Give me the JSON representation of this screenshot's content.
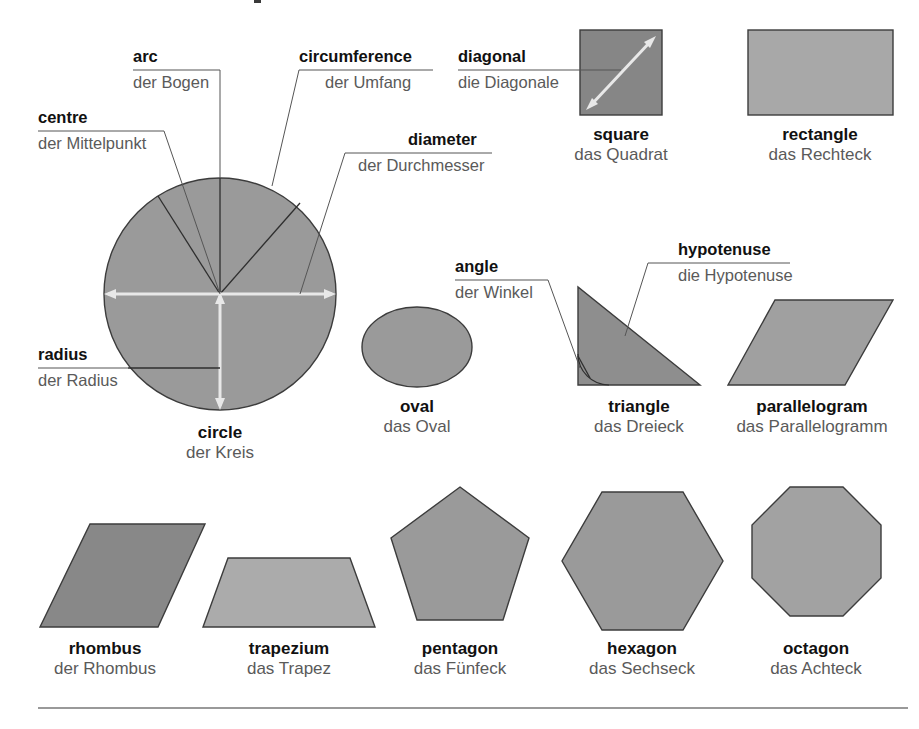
{
  "page": {
    "background_color": "#ffffff",
    "divider_color": "#777777"
  },
  "palette": {
    "shape_medium": "#9a9a9a",
    "shape_dark": "#868686",
    "shape_light": "#ababab",
    "outline": "#3c3c3c",
    "arrow_white": "#e8e8e8",
    "leader_line": "#555555",
    "text_english": "#111111",
    "text_german": "#5a5a5a"
  },
  "callouts": [
    {
      "id": "arc",
      "english": "arc",
      "german": "der Bogen"
    },
    {
      "id": "circumference",
      "english": "circumference",
      "german": "der Umfang"
    },
    {
      "id": "diagonal",
      "english": "diagonal",
      "german": "die Diagonale"
    },
    {
      "id": "centre",
      "english": "centre",
      "german": "der Mittelpunkt"
    },
    {
      "id": "diameter",
      "english": "diameter",
      "german": "der Durchmesser"
    },
    {
      "id": "radius",
      "english": "radius",
      "german": "der Radius"
    },
    {
      "id": "angle",
      "english": "angle",
      "german": "der Winkel"
    },
    {
      "id": "hypotenuse",
      "english": "hypotenuse",
      "german": "die Hypotenuse"
    }
  ],
  "shapes": [
    {
      "id": "square",
      "english": "square",
      "german": "das Quadrat",
      "fill": "#868686"
    },
    {
      "id": "rectangle",
      "english": "rectangle",
      "german": "das Rechteck",
      "fill": "#a8a8a8"
    },
    {
      "id": "circle",
      "english": "circle",
      "german": "der Kreis",
      "fill": "#9a9a9a"
    },
    {
      "id": "oval",
      "english": "oval",
      "german": "das Oval",
      "fill": "#9a9a9a"
    },
    {
      "id": "triangle",
      "english": "triangle",
      "german": "das Dreieck",
      "fill": "#8e8e8e"
    },
    {
      "id": "parallelogram",
      "english": "parallelogram",
      "german": "das Parallelogramm",
      "fill": "#a0a0a0"
    },
    {
      "id": "rhombus",
      "english": "rhombus",
      "german": "der Rhombus",
      "fill": "#888888"
    },
    {
      "id": "trapezium",
      "english": "trapezium",
      "german": "das Trapez",
      "fill": "#ababab"
    },
    {
      "id": "pentagon",
      "english": "pentagon",
      "german": "das Fünfeck",
      "fill": "#9a9a9a"
    },
    {
      "id": "hexagon",
      "english": "hexagon",
      "german": "das Sechseck",
      "fill": "#9a9a9a"
    },
    {
      "id": "octagon",
      "english": "octagon",
      "german": "das Achteck",
      "fill": "#a2a2a2"
    }
  ]
}
